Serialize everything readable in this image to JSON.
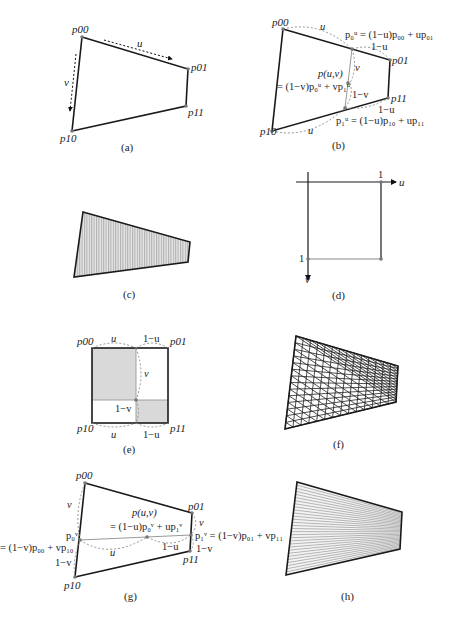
{
  "figure": {
    "panels": [
      {
        "id": "a",
        "caption": "(a)",
        "labels": {
          "p00": "p00",
          "p01": "p01",
          "p10": "p10",
          "p11": "p11",
          "u": "u",
          "v": "v"
        }
      },
      {
        "id": "b",
        "caption": "(b)",
        "labels": {
          "p00": "p00",
          "p01": "p01",
          "p10": "p10",
          "p11": "p11",
          "u_top": "u",
          "one_minus_u_top": "1−u",
          "u_bottom": "u",
          "one_minus_u_bottom": "1−u",
          "v": "v",
          "one_minus_v": "1−v",
          "puv": "p(u,v)",
          "eq_puv": "= (1−v)p₀ᵘ + vp₁ᵘ",
          "eq_p0": "p₀ᵘ = (1−u)p₀₀ + up₀₁",
          "eq_p1": "p₁ᵘ = (1−u)p₁₀ + up₁₁"
        }
      },
      {
        "id": "c",
        "caption": "(c)"
      },
      {
        "id": "d",
        "caption": "(d)",
        "labels": {
          "u": "u",
          "v": "v",
          "one_u": "1",
          "one_v": "1"
        }
      },
      {
        "id": "e",
        "caption": "(e)",
        "labels": {
          "p00": "p00",
          "p01": "p01",
          "p10": "p10",
          "p11": "p11",
          "u_top": "u",
          "one_minus_u_top": "1−u",
          "v": "v",
          "one_minus_v": "1−v",
          "u_bottom": "u",
          "one_minus_u_bottom": "1−u"
        }
      },
      {
        "id": "f",
        "caption": "(f)"
      },
      {
        "id": "g",
        "caption": "(g)",
        "labels": {
          "p00": "p00",
          "p01": "p01",
          "p10": "p10",
          "p11": "p11",
          "v_left": "v",
          "one_minus_v_left": "1−v",
          "v_right": "v",
          "one_minus_v_right": "1−v",
          "u": "u",
          "one_minus_u": "1−u",
          "puv": "p(u,v)",
          "eq_puv": "= (1−u)p₀ᵛ + up₁ᵛ",
          "p0v": "p₀ᵛ",
          "eq_p0": "= (1−v)p₀₀ + vp₁₀",
          "eq_p1": "p₁ᵛ = (1−v)p₀₁ + vp₁₁"
        }
      },
      {
        "id": "h",
        "caption": "(h)"
      }
    ],
    "colors": {
      "edge": "#1a1a1a",
      "guide": "#888888",
      "fill": "#d9d9d9",
      "point": "#777777"
    }
  }
}
